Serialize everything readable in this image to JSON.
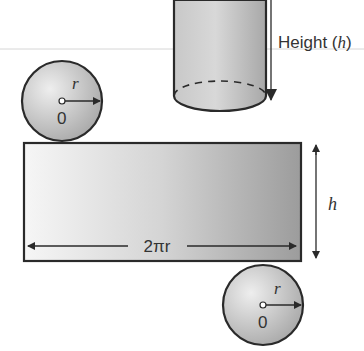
{
  "labels": {
    "height": "Height (",
    "height_var": "h",
    "height_close": ")",
    "rect_height": "h",
    "circumference": "2πr",
    "radius_top": "r",
    "center_top": "0",
    "radius_bottom": "r",
    "center_bottom": "0"
  },
  "colors": {
    "stroke": "#2a2a2a",
    "fill_light": "#f2f2f2",
    "fill_dark": "#9a9a9a",
    "guide_line": "#d0d0d0"
  }
}
